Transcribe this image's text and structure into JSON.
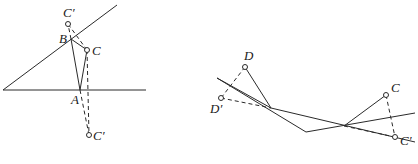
{
  "figure_left": {
    "labels": {
      "C_prime_top": "C′",
      "B": "B",
      "C": "C",
      "A": "A",
      "C_prime_bottom": "C′"
    },
    "points": {
      "angle_vertex": [
        3,
        90
      ],
      "ray_end_oblique": [
        117,
        5
      ],
      "ray_end_horizontal": [
        146,
        90
      ],
      "C_prime_top": [
        68,
        24
      ],
      "B": [
        71,
        39
      ],
      "C": [
        87,
        50
      ],
      "A": [
        80,
        90
      ],
      "C_prime_bottom": [
        89,
        135
      ]
    }
  },
  "figure_right": {
    "labels": {
      "D": "D",
      "D_prime": "D′",
      "C": "C",
      "C_prime": "C′"
    },
    "points": {
      "line1_start": [
        217,
        78
      ],
      "line1_end_vertex": [
        306,
        132
      ],
      "line2_end": [
        415,
        113
      ],
      "D": [
        245,
        67
      ],
      "D_prime": [
        221,
        98
      ],
      "P1": [
        271,
        108
      ],
      "P2": [
        344,
        126
      ],
      "C": [
        386,
        95
      ],
      "C_prime": [
        395,
        137
      ]
    }
  },
  "colors": {
    "stroke": "#2a2a2a",
    "background": "#ffffff",
    "label": "#1a1a1a"
  }
}
